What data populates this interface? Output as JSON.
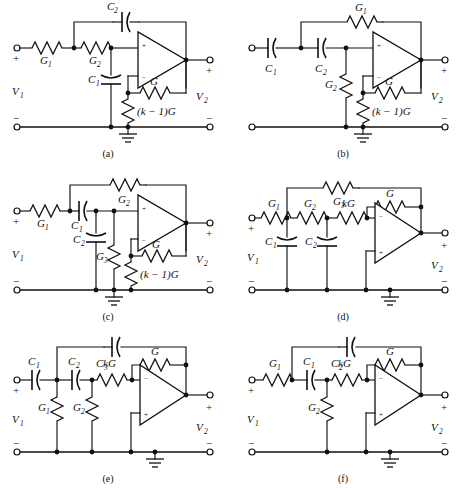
{
  "figure": {
    "panel_count": 6,
    "terminal_marks": {
      "plus": "+",
      "minus": "−"
    },
    "port_labels": {
      "input": "V",
      "input_sub": "1",
      "output": "V",
      "output_sub": "2"
    }
  },
  "panels": [
    {
      "id": "a",
      "caption": "(a)",
      "topology": "Sallen-Key low-pass (non-inverting, VCVS)",
      "opamp": {
        "top_terminal": "+",
        "bottom_terminal": "−"
      },
      "input_port": {
        "plus": "+",
        "minus": "−",
        "label": "V",
        "sub": "1"
      },
      "output_port": {
        "plus": "+",
        "minus": "−",
        "label": "V",
        "sub": "2"
      },
      "components": [
        {
          "name": "series-conductance-1",
          "type": "resistor",
          "label": "G",
          "sub": "1"
        },
        {
          "name": "series-conductance-2",
          "type": "resistor",
          "label": "G",
          "sub": "2"
        },
        {
          "name": "shunt-capacitor-1",
          "type": "capacitor",
          "label": "C",
          "sub": "1"
        },
        {
          "name": "feedback-capacitor-2",
          "type": "capacitor",
          "label": "C",
          "sub": "2"
        },
        {
          "name": "feedback-conductance",
          "type": "resistor",
          "label": "G",
          "sub": ""
        },
        {
          "name": "gain-setting-conductance",
          "type": "resistor",
          "label": "(k − 1)G",
          "sub": ""
        }
      ]
    },
    {
      "id": "b",
      "caption": "(b)",
      "topology": "Sallen-Key high-pass (non-inverting, VCVS)",
      "opamp": {
        "top_terminal": "+",
        "bottom_terminal": "−"
      },
      "input_port": {
        "plus": "",
        "minus": "",
        "label": "",
        "sub": ""
      },
      "output_port": {
        "plus": "+",
        "minus": "−",
        "label": "V",
        "sub": "2"
      },
      "components": [
        {
          "name": "series-capacitor-1",
          "type": "capacitor",
          "label": "C",
          "sub": "1"
        },
        {
          "name": "series-capacitor-2",
          "type": "capacitor",
          "label": "C",
          "sub": "2"
        },
        {
          "name": "shunt-conductance-2",
          "type": "resistor",
          "label": "G",
          "sub": "2"
        },
        {
          "name": "feedback-conductance-1",
          "type": "resistor",
          "label": "G",
          "sub": "1"
        },
        {
          "name": "feedback-conductance",
          "type": "resistor",
          "label": "G",
          "sub": ""
        },
        {
          "name": "gain-setting-conductance",
          "type": "resistor",
          "label": "(k − 1)G",
          "sub": ""
        }
      ]
    },
    {
      "id": "c",
      "caption": "(c)",
      "topology": "Sallen-Key band-pass (non-inverting, VCVS)",
      "opamp": {
        "top_terminal": "+",
        "bottom_terminal": "−"
      },
      "input_port": {
        "plus": "+",
        "minus": "−",
        "label": "V",
        "sub": "1"
      },
      "output_port": {
        "plus": "+",
        "minus": "−",
        "label": "V",
        "sub": "2"
      },
      "components": [
        {
          "name": "series-conductance-1",
          "type": "resistor",
          "label": "G",
          "sub": "1"
        },
        {
          "name": "series-capacitor-1",
          "type": "capacitor",
          "label": "C",
          "sub": "1"
        },
        {
          "name": "shunt-capacitor-2",
          "type": "capacitor",
          "label": "C",
          "sub": "2"
        },
        {
          "name": "shunt-conductance-3",
          "type": "resistor",
          "label": "G",
          "sub": "3"
        },
        {
          "name": "feedback-conductance-2",
          "type": "resistor",
          "label": "G",
          "sub": "2"
        },
        {
          "name": "feedback-conductance",
          "type": "resistor",
          "label": "G",
          "sub": ""
        },
        {
          "name": "gain-setting-conductance",
          "type": "resistor",
          "label": "(k − 1)G",
          "sub": ""
        }
      ]
    },
    {
      "id": "d",
      "caption": "(d)",
      "topology": "Infinite-gain multiple-feedback low-pass (inverting)",
      "opamp": {
        "top_terminal": "−",
        "bottom_terminal": "+"
      },
      "input_port": {
        "plus": "+",
        "minus": "−",
        "label": "V",
        "sub": "1"
      },
      "output_port": {
        "plus": "+",
        "minus": "−",
        "label": "V",
        "sub": "2"
      },
      "components": [
        {
          "name": "series-conductance-1",
          "type": "resistor",
          "label": "G",
          "sub": "1"
        },
        {
          "name": "series-conductance-2",
          "type": "resistor",
          "label": "G",
          "sub": "2"
        },
        {
          "name": "input-conductance-kg",
          "type": "resistor",
          "label": "kG",
          "sub": ""
        },
        {
          "name": "shunt-capacitor-1",
          "type": "capacitor",
          "label": "C",
          "sub": "1"
        },
        {
          "name": "shunt-capacitor-2",
          "type": "capacitor",
          "label": "C",
          "sub": "2"
        },
        {
          "name": "feedback-conductance-3",
          "type": "resistor",
          "label": "G",
          "sub": "3"
        },
        {
          "name": "feedback-conductance",
          "type": "resistor",
          "label": "G",
          "sub": ""
        }
      ]
    },
    {
      "id": "e",
      "caption": "(e)",
      "topology": "Infinite-gain multiple-feedback high-pass (inverting)",
      "opamp": {
        "top_terminal": "−",
        "bottom_terminal": "+"
      },
      "input_port": {
        "plus": "+",
        "minus": "−",
        "label": "V",
        "sub": "1"
      },
      "output_port": {
        "plus": "+",
        "minus": "−",
        "label": "V",
        "sub": "2"
      },
      "components": [
        {
          "name": "series-capacitor-1",
          "type": "capacitor",
          "label": "C",
          "sub": "1"
        },
        {
          "name": "series-capacitor-2",
          "type": "capacitor",
          "label": "C",
          "sub": "2"
        },
        {
          "name": "shunt-conductance-1",
          "type": "resistor",
          "label": "G",
          "sub": "1"
        },
        {
          "name": "shunt-conductance-2",
          "type": "resistor",
          "label": "G",
          "sub": "2"
        },
        {
          "name": "input-conductance-kg",
          "type": "resistor",
          "label": "kG",
          "sub": ""
        },
        {
          "name": "feedback-capacitor-3",
          "type": "capacitor",
          "label": "C",
          "sub": "3"
        },
        {
          "name": "feedback-conductance",
          "type": "resistor",
          "label": "G",
          "sub": ""
        }
      ]
    },
    {
      "id": "f",
      "caption": "(f)",
      "topology": "Infinite-gain multiple-feedback band-pass (inverting)",
      "opamp": {
        "top_terminal": "−",
        "bottom_terminal": "+"
      },
      "input_port": {
        "plus": "+",
        "minus": "−",
        "label": "V",
        "sub": "1"
      },
      "output_port": {
        "plus": "+",
        "minus": "−",
        "label": "V",
        "sub": "2"
      },
      "components": [
        {
          "name": "series-conductance-1",
          "type": "resistor",
          "label": "G",
          "sub": "1"
        },
        {
          "name": "series-capacitor-1",
          "type": "capacitor",
          "label": "C",
          "sub": "1"
        },
        {
          "name": "shunt-conductance-2",
          "type": "resistor",
          "label": "G",
          "sub": "2"
        },
        {
          "name": "input-conductance-kg",
          "type": "resistor",
          "label": "kG",
          "sub": ""
        },
        {
          "name": "feedback-capacitor-2",
          "type": "capacitor",
          "label": "C",
          "sub": "2"
        },
        {
          "name": "feedback-conductance",
          "type": "resistor",
          "label": "G",
          "sub": ""
        }
      ]
    }
  ]
}
